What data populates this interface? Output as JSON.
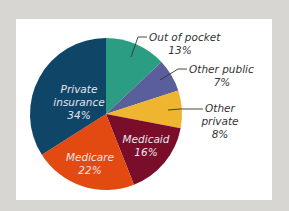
{
  "chart_data": {
    "type": "pie",
    "title": "",
    "start_angle_deg": 0,
    "direction": "clockwise",
    "slices": [
      {
        "label": "Out of pocket",
        "value": 13,
        "display": "13%",
        "color": "#2a9d83"
      },
      {
        "label": "Other public",
        "value": 7,
        "display": "7%",
        "color": "#5a5f9c"
      },
      {
        "label": "Other private",
        "value": 8,
        "display": "8%",
        "color": "#f0b530"
      },
      {
        "label": "Medicaid",
        "value": 16,
        "display": "16%",
        "color": "#7a0e2a"
      },
      {
        "label": "Medicare",
        "value": 22,
        "display": "22%",
        "color": "#e24a12"
      },
      {
        "label": "Private insurance",
        "value": 34,
        "display": "34%",
        "color": "#0f4566"
      }
    ],
    "legend": "none (direct labels)",
    "units": "percent"
  },
  "labels": {
    "out_of_pocket": {
      "line1": "Out of pocket",
      "line2": "13%"
    },
    "other_public": {
      "line1": "Other public",
      "line2": "7%"
    },
    "other_private": {
      "line1": "Other",
      "line2": "private",
      "line3": "8%"
    },
    "medicaid": {
      "line1": "Medicaid",
      "line2": "16%"
    },
    "medicare": {
      "line1": "Medicare",
      "line2": "22%"
    },
    "private_insurance": {
      "line1": "Private",
      "line2": "insurance",
      "line3": "34%"
    }
  },
  "style": {
    "background": "#d8d6d2",
    "card": "#ffffff"
  }
}
